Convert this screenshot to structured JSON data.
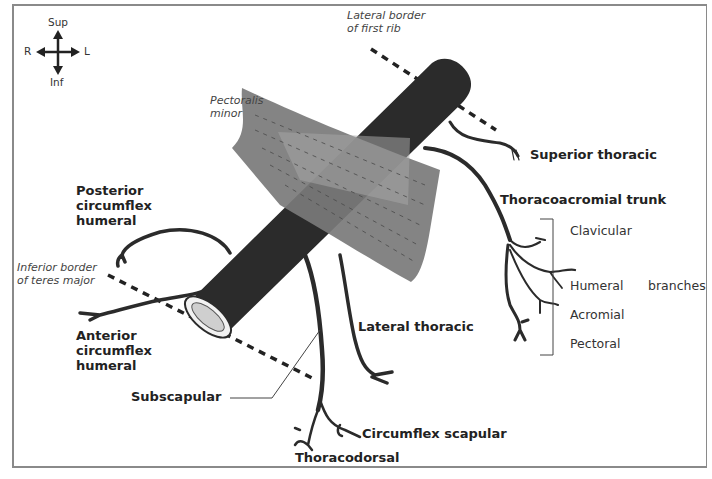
{
  "orientation": {
    "superior": "Sup",
    "inferior": "Inf",
    "right": "R",
    "left": "L"
  },
  "landmarks": {
    "first_rib": [
      "Lateral border",
      "of first rib"
    ],
    "teres_major": [
      "Inferior border",
      "of teres major"
    ],
    "muscle": [
      "Pectoralis",
      "minor"
    ]
  },
  "branches": {
    "superior_thoracic": "Superior thoracic",
    "thoracoacromial": "Thoracoacromial trunk",
    "lateral_thoracic": "Lateral thoracic",
    "posterior_circumflex": [
      "Posterior",
      "circumflex",
      "humeral"
    ],
    "anterior_circumflex": [
      "Anterior",
      "circumflex",
      "humeral"
    ],
    "subscapular": "Subscapular",
    "circumflex_scapular": "Circumflex scapular",
    "thoracodorsal": "Thoracodorsal"
  },
  "thoracoacromial_branches": {
    "items": [
      "Clavicular",
      "Humeral",
      "Acromial",
      "Pectoral"
    ],
    "group_label": "branches"
  },
  "colors": {
    "artery": "#2b2b2b",
    "muscle": "#7a7a7a",
    "muscle_overlap": "#9c9c9c",
    "frame": "#8a8a8a",
    "lumen": "#d8d8d8"
  }
}
